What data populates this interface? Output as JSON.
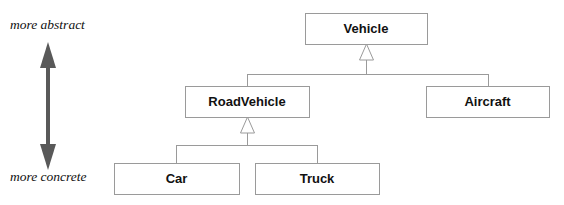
{
  "diagram": {
    "kind": "uml-class-hierarchy",
    "title": "",
    "canvas": {
      "width": 564,
      "height": 205,
      "background": "#ffffff"
    },
    "style": {
      "box_fill": "#ffffff",
      "box_stroke": "#9a9a9a",
      "label_color": "#111111",
      "connector_stroke": "#9a9a9a",
      "axis_color": "#595959"
    },
    "axis": {
      "name": "abstraction-axis",
      "top_label": "more abstract",
      "bottom_label": "more concrete",
      "direction": "double-headed-vertical",
      "x": 48,
      "y_top": 42,
      "y_bottom": 170,
      "top_label_x": 10,
      "top_label_y": 26,
      "bottom_label_x": 10,
      "bottom_label_y": 178
    },
    "nodes": [
      {
        "id": "vehicle",
        "label": "Vehicle",
        "x": 305,
        "y": 13,
        "w": 122,
        "h": 31,
        "level": 0
      },
      {
        "id": "roadvehicle",
        "label": "RoadVehicle",
        "x": 185,
        "y": 86,
        "w": 124,
        "h": 31,
        "level": 1
      },
      {
        "id": "aircraft",
        "label": "Aircraft",
        "x": 426,
        "y": 86,
        "w": 123,
        "h": 31,
        "level": 1
      },
      {
        "id": "car",
        "label": "Car",
        "x": 114,
        "y": 163,
        "w": 125,
        "h": 31,
        "level": 2
      },
      {
        "id": "truck",
        "label": "Truck",
        "x": 255,
        "y": 163,
        "w": 124,
        "h": 31,
        "level": 2
      }
    ],
    "generalizations": [
      {
        "id": "gen-vehicle",
        "parent": "vehicle",
        "children": [
          "roadvehicle",
          "aircraft"
        ],
        "arrow_x": 366,
        "arrow_tip_y": 44,
        "arrow_base_y": 60,
        "arrow_half_width": 7,
        "bus_y": 74,
        "bus_left_x": 247,
        "bus_right_x": 488,
        "child_drop_x": [
          247,
          488
        ]
      },
      {
        "id": "gen-roadvehicle",
        "parent": "roadvehicle",
        "children": [
          "car",
          "truck"
        ],
        "arrow_x": 247,
        "arrow_tip_y": 117,
        "arrow_base_y": 133,
        "arrow_half_width": 7,
        "bus_y": 145,
        "bus_left_x": 176,
        "bus_right_x": 317,
        "child_drop_x": [
          176,
          317
        ]
      }
    ]
  }
}
